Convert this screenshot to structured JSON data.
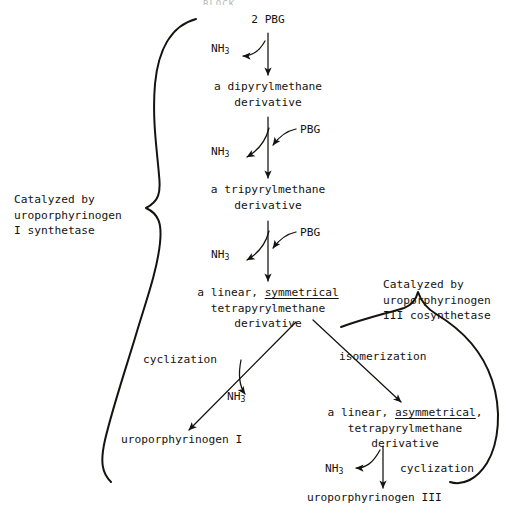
{
  "figure": {
    "top_artifact": "BLOCK"
  },
  "nodes": {
    "start": "2 PBG",
    "dipyrryl_line1": "a dipyrylmethane",
    "dipyrryl_line2": "derivative",
    "tripyrryl_line1": "a tripyrylmethane",
    "tripyrryl_line2": "derivative",
    "sym_prefix": "a linear, ",
    "sym_underlined": "symmetrical",
    "sym_line2": "tetrapyrylmethane",
    "sym_line3": "derivative",
    "asym_prefix": "a linear, ",
    "asym_underlined": "asymmetrical",
    "asym_suffix": ",",
    "asym_line2": "tetrapyrylmethane",
    "asym_line3": "derivative",
    "product_I": "uroporphyrinogen I",
    "product_III": "uroporphyrinogen III"
  },
  "reagents": {
    "pbg_1": "PBG",
    "pbg_2": "PBG",
    "ammonia_1": "NH",
    "ammonia_1_sub": "3",
    "ammonia_2": "NH",
    "ammonia_2_sub": "3",
    "ammonia_3": "NH",
    "ammonia_3_sub": "3",
    "ammonia_4": "NH",
    "ammonia_4_sub": "3",
    "ammonia_5": "NH",
    "ammonia_5_sub": "3"
  },
  "reactions": {
    "cyclization_left": "cyclization",
    "isomerization": "isomerization",
    "cyclization_right": "cyclization"
  },
  "enzymes": {
    "left": {
      "line1": "Catalyzed by",
      "line2": "uroporphyrinogen",
      "line3": "I synthetase"
    },
    "right": {
      "line1": "Catalyzed by",
      "line2": "uroporphyrinogen",
      "line3": "III cosynthetase"
    }
  },
  "style": {
    "ink": "#15130f",
    "paper": "#ffffff"
  }
}
